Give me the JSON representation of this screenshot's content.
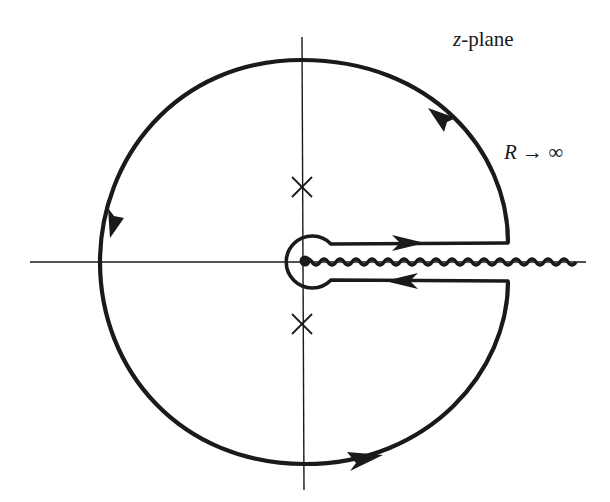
{
  "figure": {
    "title_label": {
      "variable": "z",
      "suffix": "-plane"
    },
    "radius_label": {
      "variable": "R",
      "arrow": "→",
      "limit": "∞"
    },
    "elements": {
      "axes": [
        "real-axis",
        "imaginary-axis"
      ],
      "contour": "keyhole contour: large circle of radius R with indentation around branch point at origin",
      "branch_cut": "wavy line along positive real axis from origin",
      "poles": [
        {
          "position": "positive imaginary axis",
          "marker": "×"
        },
        {
          "position": "negative imaginary axis",
          "marker": "×"
        }
      ],
      "branch_point": {
        "position": "origin",
        "marker": "●"
      },
      "orientation_arrows": [
        "upper-right arc pointing up-left (counterclockwise)",
        "left arc pointing down",
        "bottom arc pointing right",
        "upper edge of cut pointing right",
        "lower edge of cut pointing left"
      ]
    },
    "colors": {
      "ink": "#1a1a1a",
      "background": "#ffffff"
    }
  }
}
